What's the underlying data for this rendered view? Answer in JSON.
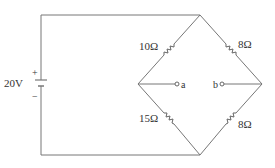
{
  "diagram": {
    "type": "wheatstone-bridge",
    "source": {
      "label": "20V",
      "plus": "+",
      "minus": "−"
    },
    "resistors": {
      "top_left": "10Ω",
      "top_right": "8Ω",
      "bottom_left": "15Ω",
      "bottom_right": "8Ω"
    },
    "nodes": {
      "a": "a",
      "b": "b"
    },
    "colors": {
      "wire": "#777777",
      "text": "#333333"
    }
  }
}
